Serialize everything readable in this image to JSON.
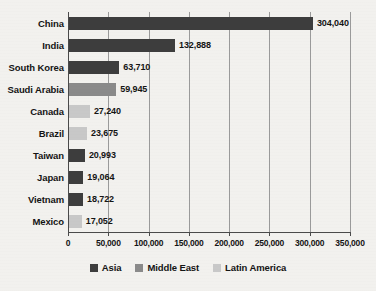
{
  "chart_data": {
    "type": "bar",
    "orientation": "horizontal",
    "title": "",
    "xlabel": "",
    "ylabel": "",
    "xlim": [
      0,
      350000
    ],
    "xticks": [
      0,
      50000,
      100000,
      150000,
      200000,
      250000,
      300000,
      350000
    ],
    "xtick_labels": [
      "0",
      "50,000",
      "100,000",
      "150,000",
      "200,000",
      "250,000",
      "300,000",
      "350,000"
    ],
    "grid": true,
    "grid_axis": "x",
    "legend_position": "bottom",
    "categories": [
      "China",
      "India",
      "South Korea",
      "Saudi Arabia",
      "Canada",
      "Brazil",
      "Taiwan",
      "Japan",
      "Vietnam",
      "Mexico"
    ],
    "values": [
      304040,
      132888,
      63710,
      59945,
      27240,
      23675,
      20993,
      19064,
      18722,
      17052
    ],
    "value_labels": [
      "304,040",
      "132,888",
      "63,710",
      "59,945",
      "27,240",
      "23,675",
      "20,993",
      "19,064",
      "18,722",
      "17,052"
    ],
    "groups": [
      "Asia",
      "Asia",
      "Asia",
      "Middle East",
      "Latin America",
      "Latin America",
      "Asia",
      "Asia",
      "Asia",
      "Latin America"
    ],
    "series": [
      {
        "name": "Asia",
        "color": "#3d3d3d",
        "points": [
          {
            "category": "China",
            "value": 304040,
            "label": "304,040"
          },
          {
            "category": "India",
            "value": 132888,
            "label": "132,888"
          },
          {
            "category": "South Korea",
            "value": 63710,
            "label": "63,710"
          },
          {
            "category": "Taiwan",
            "value": 20993,
            "label": "20,993"
          },
          {
            "category": "Japan",
            "value": 19064,
            "label": "19,064"
          },
          {
            "category": "Vietnam",
            "value": 18722,
            "label": "18,722"
          }
        ]
      },
      {
        "name": "Middle East",
        "color": "#8a8a8a",
        "points": [
          {
            "category": "Saudi Arabia",
            "value": 59945,
            "label": "59,945"
          }
        ]
      },
      {
        "name": "Latin America",
        "color": "#c8c8c8",
        "points": [
          {
            "category": "Canada",
            "value": 27240,
            "label": "27,240"
          },
          {
            "category": "Brazil",
            "value": 23675,
            "label": "23,675"
          },
          {
            "category": "Mexico",
            "value": 17052,
            "label": "17,052"
          }
        ]
      }
    ]
  },
  "legend": {
    "items": [
      {
        "label": "Asia",
        "color": "#3d3d3d",
        "class": "asia"
      },
      {
        "label": "Middle East",
        "color": "#8a8a8a",
        "class": "middle-east"
      },
      {
        "label": "Latin America",
        "color": "#c8c8c8",
        "class": "latin-america"
      }
    ]
  },
  "colors": {
    "asia": "#3d3d3d",
    "middle_east": "#8a8a8a",
    "latin_america": "#c8c8c8",
    "background": "#f2f1ee",
    "axis": "#4a4a4a",
    "gridline": "#9a9a9a",
    "text": "#141414"
  }
}
